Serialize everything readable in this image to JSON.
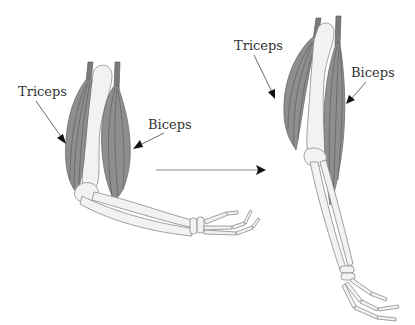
{
  "diagram": {
    "left_arm": {
      "state": "flexed",
      "labels": {
        "triceps": "Triceps",
        "biceps": "Biceps"
      }
    },
    "right_arm": {
      "state": "extended",
      "labels": {
        "triceps": "Triceps",
        "biceps": "Biceps"
      }
    },
    "transition_arrow": {
      "direction": "left-to-right"
    },
    "colors": {
      "muscle": "#8e8e8e",
      "muscle_fiber": "#5f5f5f",
      "bone": "#f2f2f2",
      "bone_outline": "#8a8a8a",
      "text": "#333333",
      "arrowhead": "#111111",
      "background": "#ffffff"
    }
  }
}
